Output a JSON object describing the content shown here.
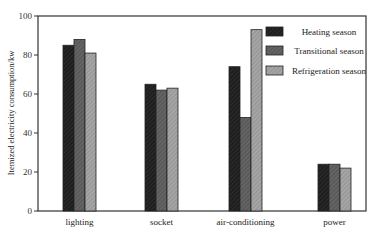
{
  "chart_data": {
    "type": "bar",
    "title": "",
    "xlabel": "",
    "ylabel": "Itemized electricity consumption/kw",
    "ylim": [
      0,
      100
    ],
    "yticks": [
      0,
      20,
      40,
      60,
      80,
      100
    ],
    "grid": false,
    "legend_position": "upper right (inside)",
    "categories": [
      "lighting",
      "socket",
      "air-conditioning",
      "power"
    ],
    "series": [
      {
        "name": "Heating season",
        "color": "#1e1e1e",
        "values": [
          85,
          65,
          74,
          24
        ]
      },
      {
        "name": "Transitional season",
        "color": "#5a5a5a",
        "values": [
          88,
          62,
          48,
          24
        ]
      },
      {
        "name": "Refrigeration season",
        "color": "#999999",
        "values": [
          81,
          63,
          93,
          22
        ]
      }
    ]
  }
}
